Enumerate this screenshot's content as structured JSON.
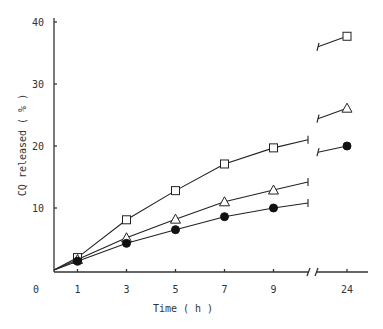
{
  "chart_data": {
    "type": "line",
    "title": "",
    "xlabel": "Time ( h )",
    "ylabel": "CQ released ( % )",
    "x": [
      1,
      3,
      5,
      7,
      9,
      24
    ],
    "x_tick_labels": [
      "0",
      "1",
      "3",
      "5",
      "7",
      "9",
      "24"
    ],
    "y_tick_labels": [
      "40",
      "30",
      "20",
      "10"
    ],
    "ylim": [
      0,
      40
    ],
    "x_axis_break": "between 9 and 24",
    "grid": false,
    "legend": "none",
    "series": [
      {
        "name": "open-square",
        "marker": "square-open",
        "values": [
          2.0,
          8.1,
          12.8,
          17.1,
          19.7,
          37.7
        ]
      },
      {
        "name": "open-triangle",
        "marker": "triangle-open",
        "values": [
          1.7,
          5.2,
          8.2,
          11.0,
          12.9,
          26.1
        ]
      },
      {
        "name": "filled-circle",
        "marker": "circle-filled",
        "values": [
          1.4,
          4.3,
          6.5,
          8.6,
          10.0,
          20.0
        ]
      }
    ],
    "break_segments": {
      "left_end": {
        "open-square": 21.0,
        "open-triangle": 14.2,
        "filled-circle": 10.8
      },
      "right_start": {
        "open-square": 36.0,
        "open-triangle": 24.4,
        "filled-circle": 19.0
      }
    }
  }
}
